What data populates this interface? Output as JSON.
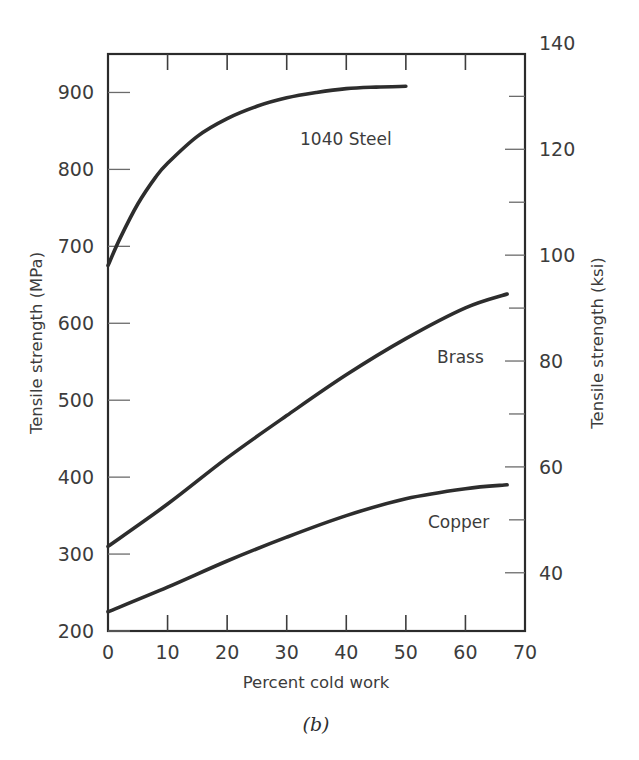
{
  "figure": {
    "caption": "(b)"
  },
  "chart_data": {
    "type": "line",
    "title": "",
    "xlabel": "Percent cold work",
    "ylabel": "Tensile strength (MPa)",
    "ylabel_secondary": "Tensile strength (ksi)",
    "xlim": [
      0,
      70
    ],
    "ylim": [
      200,
      950
    ],
    "ylim_secondary": [
      29,
      138
    ],
    "grid": false,
    "legend": "inline-annotations",
    "xticks": [
      0,
      10,
      20,
      30,
      40,
      50,
      60,
      70
    ],
    "xticklabels": [
      "0",
      "10",
      "20",
      "30",
      "40",
      "50",
      "60",
      "70"
    ],
    "yticks": [
      200,
      300,
      400,
      500,
      600,
      700,
      800,
      900
    ],
    "yticklabels": [
      "200",
      "300",
      "400",
      "500",
      "600",
      "700",
      "800",
      "900"
    ],
    "yticks_secondary": [
      40,
      60,
      80,
      100,
      120,
      140
    ],
    "yticklabels_secondary": [
      "40",
      "60",
      "80",
      "100",
      "120",
      "140"
    ],
    "yminor_secondary": [
      50,
      70,
      90,
      110,
      130
    ],
    "series": [
      {
        "name": "1040 Steel",
        "units": "MPa",
        "x": [
          0,
          2,
          5,
          8,
          10,
          15,
          20,
          25,
          30,
          35,
          40,
          45,
          50
        ],
        "values": [
          675,
          710,
          755,
          790,
          808,
          843,
          866,
          882,
          893,
          900,
          905,
          907,
          908
        ]
      },
      {
        "name": "Brass",
        "units": "MPa",
        "x": [
          0,
          10,
          20,
          30,
          40,
          50,
          60,
          67
        ],
        "values": [
          310,
          365,
          425,
          480,
          533,
          580,
          620,
          638
        ]
      },
      {
        "name": "Copper",
        "units": "MPa",
        "x": [
          0,
          10,
          20,
          30,
          40,
          50,
          60,
          67
        ],
        "values": [
          225,
          257,
          291,
          322,
          350,
          372,
          385,
          390
        ]
      }
    ]
  }
}
